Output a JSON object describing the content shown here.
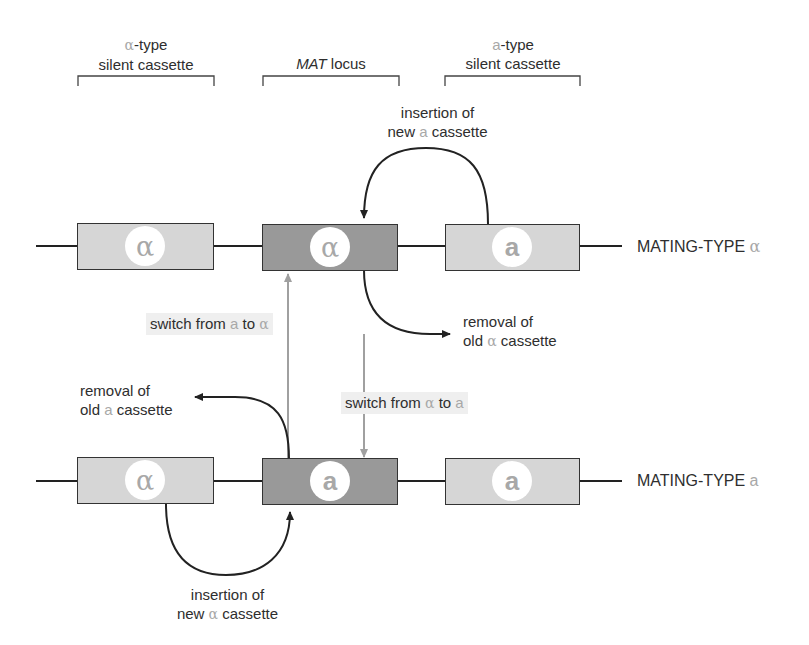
{
  "headers": {
    "alpha_silent": {
      "symbol": "α",
      "line1_suffix": "-type",
      "line2": "silent cassette"
    },
    "mat_locus": {
      "italic": "MAT",
      "rest": " locus"
    },
    "a_silent": {
      "symbol": "a",
      "line1_suffix": "-type",
      "line2": "silent cassette"
    }
  },
  "top_row": {
    "label_prefix": "MATING-TYPE ",
    "label_symbol": "α",
    "cassettes": [
      {
        "role": "alpha-silent",
        "symbol": "α"
      },
      {
        "role": "mat-locus",
        "symbol": "α"
      },
      {
        "role": "a-silent",
        "symbol": "a"
      }
    ]
  },
  "bottom_row": {
    "label_prefix": "MATING-TYPE ",
    "label_symbol": "a",
    "cassettes": [
      {
        "role": "alpha-silent",
        "symbol": "α"
      },
      {
        "role": "mat-locus",
        "symbol": "a"
      },
      {
        "role": "a-silent",
        "symbol": "a"
      }
    ]
  },
  "annotations": {
    "insert_new_a": {
      "line1": "insertion of",
      "line2_pre": "new ",
      "symbol": "a",
      "line2_post": " cassette"
    },
    "remove_old_alpha": {
      "line1": "removal of",
      "line2_pre": "old ",
      "symbol": "α",
      "line2_post": " cassette"
    },
    "switch_a_to_alpha": {
      "pre": "switch from ",
      "sym1": "a",
      "mid": " to ",
      "sym2": "α"
    },
    "switch_alpha_to_a": {
      "pre": "switch from ",
      "sym1": "α",
      "mid": " to ",
      "sym2": "a"
    },
    "remove_old_a": {
      "line1": "removal of",
      "line2_pre": "old ",
      "symbol": "a",
      "line2_post": " cassette"
    },
    "insert_new_alpha": {
      "line1": "insertion of",
      "line2_pre": "new ",
      "symbol": "α",
      "line2_post": " cassette"
    }
  },
  "colors": {
    "silent_box": "#d6d6d6",
    "mat_box": "#999999",
    "symbol_gray": "#a8a8a8",
    "switch_arrow": "#a0a0a0",
    "line": "#222222"
  }
}
